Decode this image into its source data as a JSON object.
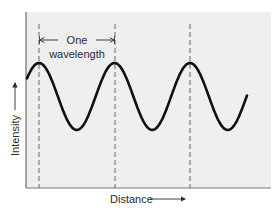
{
  "diagram": {
    "annotation": {
      "line1": "One",
      "line2": "wavelength"
    },
    "y_axis_label": "Intensity",
    "x_axis_label": "Distance",
    "wave": {
      "cycles_shown": 3,
      "peaks_marked": 3,
      "wavelength_units": 1
    },
    "colors": {
      "plot_background": "#efefef",
      "wave": "#111111",
      "axis": "#555555",
      "dashed": "#666666",
      "text": "#2a2a2a"
    }
  }
}
